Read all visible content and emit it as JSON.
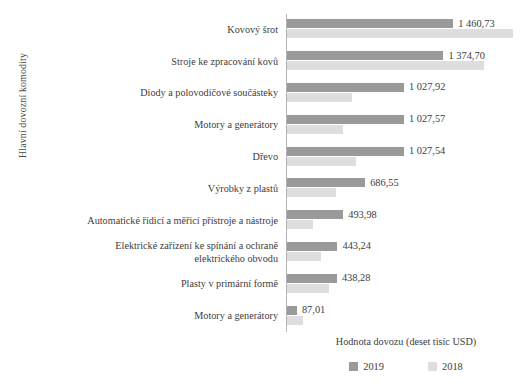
{
  "chart_data": {
    "type": "bar",
    "orientation": "horizontal",
    "title": "",
    "xlabel": "Hodnota dovozu (deset tisíc USD)",
    "ylabel": "Hlavní dovozní komodity",
    "grid": false,
    "legend_position": "bottom",
    "xlim": [
      0,
      1600
    ],
    "categories": [
      "Kovový šrot",
      "Stroje ke zpracování kovů",
      "Diody a polovodičové součásteky",
      "Motory a generátory",
      "Dřevo",
      "Výrobky z plastů",
      "Automatické řídicí a měřicí přístroje a nástroje",
      "Elektrické zařízení ke spínání a ochraně\nelektrického obvodu",
      "Plasty v primární formě",
      "Motory a generátory"
    ],
    "series": [
      {
        "name": "2019",
        "color": "#9a9a9a",
        "values": [
          1460.73,
          1374.7,
          1027.92,
          1027.57,
          1027.54,
          686.55,
          493.98,
          443.24,
          438.28,
          87.01
        ],
        "labels": [
          "1 460,73",
          "1 374,70",
          "1 027,92",
          "1 027,57",
          "1 027,54",
          "686,55",
          "493,98",
          "443,24",
          "438,28",
          "87,01"
        ]
      },
      {
        "name": "2018",
        "color": "#dedede",
        "values": [
          1990.0,
          1730.0,
          570.0,
          490.0,
          610.0,
          430.0,
          230.0,
          300.0,
          370.0,
          140.0
        ],
        "labels": [
          "",
          "",
          "",
          "",
          "",
          "",
          "",
          "",
          "",
          ""
        ]
      }
    ]
  },
  "legend": {
    "items": [
      {
        "label": "2019",
        "color": "#9a9a9a"
      },
      {
        "label": "2018",
        "color": "#dedede"
      }
    ]
  },
  "colors": {
    "series_2019": "#9a9a9a",
    "series_2018": "#dedede",
    "axis": "#b3b3b3",
    "text": "#3d3d3d",
    "background": "#ffffff"
  }
}
